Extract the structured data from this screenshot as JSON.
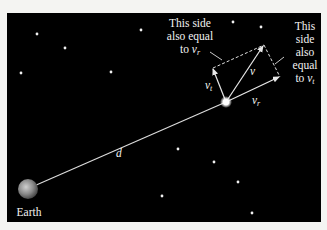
{
  "diagram": {
    "background_color": "#000000",
    "earth": {
      "label": "Earth",
      "x": 28,
      "y": 189,
      "r": 10
    },
    "star_source": {
      "x": 226,
      "y": 102
    },
    "distance_label": "d",
    "vectors": {
      "v": {
        "symbol": "v",
        "subscript": "",
        "end": [
          264,
          45
        ]
      },
      "v_t": {
        "symbol": "v",
        "subscript": "t",
        "end": [
          212,
          68
        ]
      },
      "v_r": {
        "symbol": "v",
        "subscript": "r",
        "end": [
          280,
          77
        ]
      }
    },
    "annotation_left": {
      "lines": [
        "This side",
        "also equal",
        "to "
      ],
      "var_symbol": "v",
      "var_sub": "r"
    },
    "annotation_right": {
      "lines": [
        "This",
        "side",
        "also",
        "equal",
        "to "
      ],
      "var_symbol": "v",
      "var_sub": "t"
    },
    "stars": [
      [
        37,
        34
      ],
      [
        65,
        48
      ],
      [
        141,
        30
      ],
      [
        21,
        73
      ],
      [
        111,
        72
      ],
      [
        233,
        22
      ],
      [
        261,
        27
      ],
      [
        178,
        149
      ],
      [
        214,
        162
      ],
      [
        238,
        182
      ],
      [
        162,
        196
      ],
      [
        252,
        213
      ]
    ]
  }
}
